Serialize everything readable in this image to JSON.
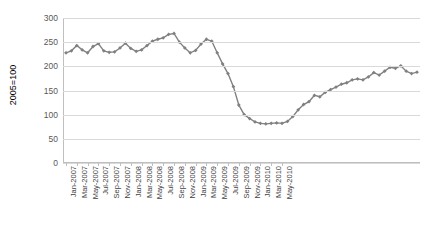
{
  "chart_data": {
    "type": "line",
    "title": "",
    "xlabel": "",
    "ylabel": "2005=100",
    "ylim": [
      0,
      300
    ],
    "ytick_values": [
      0,
      50,
      100,
      150,
      200,
      250,
      300
    ],
    "ytick_labels": [
      "0",
      "50",
      "100",
      "150",
      "200",
      "250",
      "300"
    ],
    "grid": true,
    "legend": false,
    "marker": "diamond",
    "series_color": "#808080",
    "grid_color": "#d9d9d9",
    "axis_color": "#bfbfbf",
    "x": [
      "Jan-2007",
      "Feb-2007",
      "Mar-2007",
      "Apr-2007",
      "May-2007",
      "Jun-2007",
      "Jul-2007",
      "Aug-2007",
      "Sep-2007",
      "Oct-2007",
      "Nov-2007",
      "Dec-2007",
      "Jan-2008",
      "Feb-2008",
      "Mar-2008",
      "Apr-2008",
      "May-2008",
      "Jun-2008",
      "Jul-2008",
      "Aug-2008",
      "Sep-2008",
      "Oct-2008",
      "Nov-2008",
      "Dec-2008",
      "Jan-2009",
      "Feb-2009",
      "Mar-2009",
      "Apr-2009",
      "May-2009",
      "Jun-2009",
      "Jul-2009",
      "Aug-2009",
      "Sep-2009",
      "Oct-2009",
      "Nov-2009",
      "Dec-2009",
      "Jan-2010",
      "Feb-2010",
      "Mar-2010",
      "Apr-2010",
      "May-2010",
      "Jun-2010"
    ],
    "xtick_labels": [
      "Jan-2007",
      "Mar-2007",
      "May-2007",
      "Jul-2007",
      "Sep-2007",
      "Nov-2007",
      "Jan-2008",
      "Mar-2008",
      "May-2008",
      "Jul-2008",
      "Sep-2008",
      "Nov-2008",
      "Jan-2009",
      "Mar-2009",
      "May-2009",
      "Jul-2009",
      "Sep-2009",
      "Nov-2009",
      "Jan-2010",
      "Mar-2010",
      "May-2010"
    ],
    "values": [
      228,
      232,
      243,
      234,
      228,
      241,
      247,
      232,
      229,
      230,
      238,
      248,
      237,
      231,
      234,
      243,
      252,
      256,
      259,
      266,
      268,
      250,
      238,
      228,
      233,
      246,
      256,
      252,
      228,
      205,
      185,
      158,
      120,
      100,
      92,
      85,
      82,
      81,
      82,
      83,
      82,
      86
    ],
    "values_tail": [
      96,
      110,
      121,
      127,
      140,
      137,
      146,
      152,
      157,
      163,
      166,
      172,
      174,
      172,
      178,
      187,
      182,
      190,
      198,
      196,
      201,
      190,
      185,
      188
    ]
  }
}
